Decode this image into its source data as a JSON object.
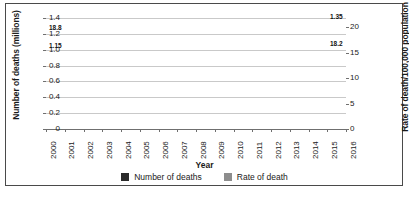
{
  "chart_data": {
    "type": "line",
    "title": "",
    "xlabel": "Year",
    "ylabel": "Number of deaths (millions)",
    "y2label": "Rate of death/100,000 population",
    "grid": true,
    "legend_position": "bottom",
    "categories": [
      "2000",
      "2001",
      "2002",
      "2003",
      "2004",
      "2005",
      "2006",
      "2007",
      "2008",
      "2009",
      "2010",
      "2011",
      "2012",
      "2013",
      "2014",
      "2015",
      "2016"
    ],
    "ylim": [
      0,
      1.4
    ],
    "yticks": [
      "0",
      "0.2",
      "0.4",
      "0.6",
      "0.8",
      "1.0",
      "1.2",
      "1.4"
    ],
    "y2lim": [
      0,
      21.78
    ],
    "y2ticks": [
      "0",
      "5",
      "10",
      "15",
      "20"
    ],
    "series": [
      {
        "name": "Number of deaths",
        "axis": "left",
        "color": "#2b2b2b",
        "values": [
          1.15,
          1.17,
          1.2,
          1.21,
          1.22,
          1.24,
          1.25,
          1.26,
          1.27,
          1.27,
          1.27,
          1.28,
          1.29,
          1.29,
          1.3,
          1.31,
          1.35
        ]
      },
      {
        "name": "Rate of death",
        "axis": "right",
        "color": "#8d8d8d",
        "values": [
          18.8,
          18.9,
          19.1,
          19.0,
          19.0,
          19.2,
          19.0,
          19.0,
          19.0,
          18.9,
          18.8,
          18.8,
          18.6,
          18.5,
          18.4,
          18.3,
          18.2
        ]
      }
    ],
    "annotations": [
      {
        "text": "18.8",
        "series": "Rate of death",
        "point": "2000",
        "position": "above-left"
      },
      {
        "text": "1.15",
        "series": "Number of deaths",
        "point": "2000",
        "position": "below-left"
      },
      {
        "text": "1.35",
        "series": "Number of deaths",
        "point": "2016",
        "position": "above-right"
      },
      {
        "text": "18.2",
        "series": "Rate of death",
        "point": "2016",
        "position": "below-right"
      }
    ],
    "legend": [
      {
        "label": "Number of deaths",
        "color": "#2b2b2b"
      },
      {
        "label": "Rate of death",
        "color": "#8d8d8d"
      }
    ]
  }
}
